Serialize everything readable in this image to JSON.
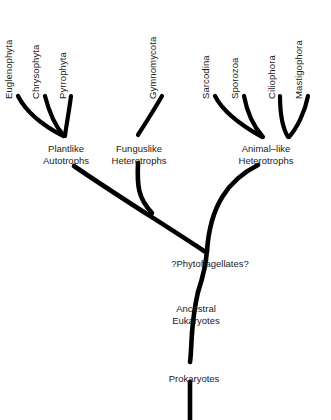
{
  "diagram": {
    "stroke_color": "#000000",
    "background_color": "#ffffff",
    "tip_labels": [
      {
        "id": "euglenophyta",
        "text": "Euglenophyta",
        "x": 14,
        "y": 88
      },
      {
        "id": "chrysophyta",
        "text": "Chrysophyta",
        "x": 41,
        "y": 88
      },
      {
        "id": "pyrrophyta",
        "text": "Pyrrophyta",
        "x": 68,
        "y": 88
      },
      {
        "id": "gymnomycota",
        "text": "Gymnomycota",
        "x": 158,
        "y": 88
      },
      {
        "id": "sarcodina",
        "text": "Sarcodina",
        "x": 211,
        "y": 88
      },
      {
        "id": "sporozoa",
        "text": "Sporozoa",
        "x": 240,
        "y": 88
      },
      {
        "id": "ciliophora",
        "text": "Ciliophora",
        "x": 277,
        "y": 88
      },
      {
        "id": "mastigophora",
        "text": "Mastigophora",
        "x": 304,
        "y": 88
      }
    ],
    "node_labels": [
      {
        "id": "plantlike-autotrophs",
        "line1": "Plantlike",
        "line2": "Autotrophs",
        "x": 66,
        "y": 143
      },
      {
        "id": "funguslike-heterotrophs",
        "line1": "Funguslike",
        "line2": "Heterotrophs",
        "x": 139,
        "y": 143
      },
      {
        "id": "animal-like-heterotrophs",
        "line1": "Animal–like",
        "line2": "Heterotrophs",
        "x": 266,
        "y": 143
      },
      {
        "id": "phytoflagellates",
        "line1": "?Phytoflagellates?",
        "line2": "",
        "x": 210,
        "y": 258
      },
      {
        "id": "ancestral-eukaryotes",
        "line1": "Ancestral",
        "line2": "Eukaryotes",
        "x": 196,
        "y": 303
      },
      {
        "id": "prokaryotes",
        "line1": "Prokaryotes",
        "line2": "",
        "x": 194,
        "y": 373
      }
    ],
    "branches": [
      {
        "id": "branch-euglenophyta",
        "d": "M 18 96 C 26 112 44 126 63 136",
        "width": 4.2
      },
      {
        "id": "branch-chrysophyta",
        "d": "M 45 96 C 49 112 56 127 64 136",
        "width": 4.2
      },
      {
        "id": "branch-pyrrophyta",
        "d": "M 71 96 C 69 112 66 127 65 136",
        "width": 4.2
      },
      {
        "id": "branch-gymnomycota",
        "d": "M 162 96 C 154 110 145 124 138 135",
        "width": 4.2
      },
      {
        "id": "branch-sarcodina",
        "d": "M 215 96 C 224 114 246 128 262 137",
        "width": 4.2
      },
      {
        "id": "branch-sporozoa",
        "d": "M 244 96 C 247 112 253 126 263 137",
        "width": 4.2
      },
      {
        "id": "branch-ciliophora",
        "d": "M 280 96 C 280 112 282 127 288 137",
        "width": 4.2
      },
      {
        "id": "branch-mastigophora",
        "d": "M 308 96 C 305 112 297 128 289 137",
        "width": 4.2
      },
      {
        "id": "branch-plantlike-stem",
        "d": "M 74 166 C 116 195 168 227 204 251",
        "width": 4.6
      },
      {
        "id": "branch-funguslike-stem",
        "d": "M 138 163 C 137 186 138 198 152 213",
        "width": 4.6
      },
      {
        "id": "branch-animallike-stem",
        "d": "M 258 165 C 228 180 210 206 207 251",
        "width": 4.6
      },
      {
        "id": "branch-trunk-upper",
        "d": "M 207 250 C 206 266 202 280 198 292",
        "width": 4.6
      },
      {
        "id": "branch-trunk-mid",
        "d": "M 198 292 C 195 305 193 320 192 333",
        "width": 4.6
      },
      {
        "id": "branch-trunk-lower",
        "d": "M 192 333 C 191 348 191 356 190 362",
        "width": 4.6
      },
      {
        "id": "branch-trunk-base",
        "d": "M 190 382 L 190 420",
        "width": 4.6
      }
    ]
  }
}
